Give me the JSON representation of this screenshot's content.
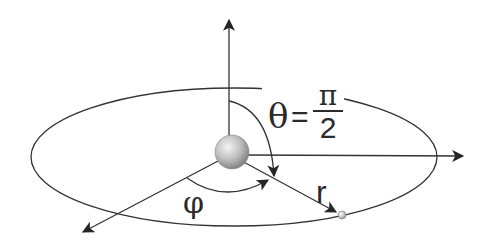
{
  "diagram": {
    "labels": {
      "theta_symbol": "θ",
      "equals": "=",
      "pi": "π",
      "two": "2",
      "radius": "r",
      "azimuth": "φ"
    },
    "elements": {
      "orbit": "ellipse",
      "central_body": "sphere",
      "orbiting_body": "small sphere",
      "axes": [
        "z-axis (up)",
        "x-axis (right)",
        "y-axis (diagonal front-left)"
      ],
      "vectors": [
        "r"
      ],
      "angles": [
        "θ = π/2",
        "φ"
      ]
    },
    "colors": {
      "line": "#333333",
      "sphere_light": "#f2f2f2",
      "sphere_dark": "#8a8a8a",
      "background": "#ffffff"
    }
  }
}
